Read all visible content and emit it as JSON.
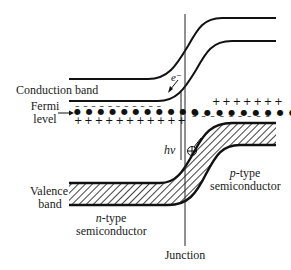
{
  "diagram": {
    "labels": {
      "conduction_band": "Conduction band",
      "fermi_level_line1": "Fermi",
      "fermi_level_line2": "level",
      "valence_band_line1": "Valence",
      "valence_band_line2": "band",
      "n_type_prefix": "n",
      "n_type_suffix": "-type",
      "n_type_line2": "semiconductor",
      "p_type_prefix": "p",
      "p_type_suffix": "-type",
      "p_type_line2": "semiconductor",
      "junction": "Junction",
      "photon": "hν",
      "electron": "e⁻",
      "hole": "⊕"
    },
    "n_side": {
      "electrons_row": "– – – – – – – – – – –",
      "donor_dots_row": "● ● ● ● ● ● ● ● ● ● ●",
      "donor_ions_row": "+ + + + + + + + + + +"
    },
    "p_side": {
      "holes_row": "+ + + + + + +",
      "acceptor_dots_row": "● ● ● ● ● ● ● ● ●",
      "acceptor_ions_row": "– – – – – – – – –"
    },
    "colors": {
      "line": "#111111",
      "background": "#ffffff"
    }
  }
}
